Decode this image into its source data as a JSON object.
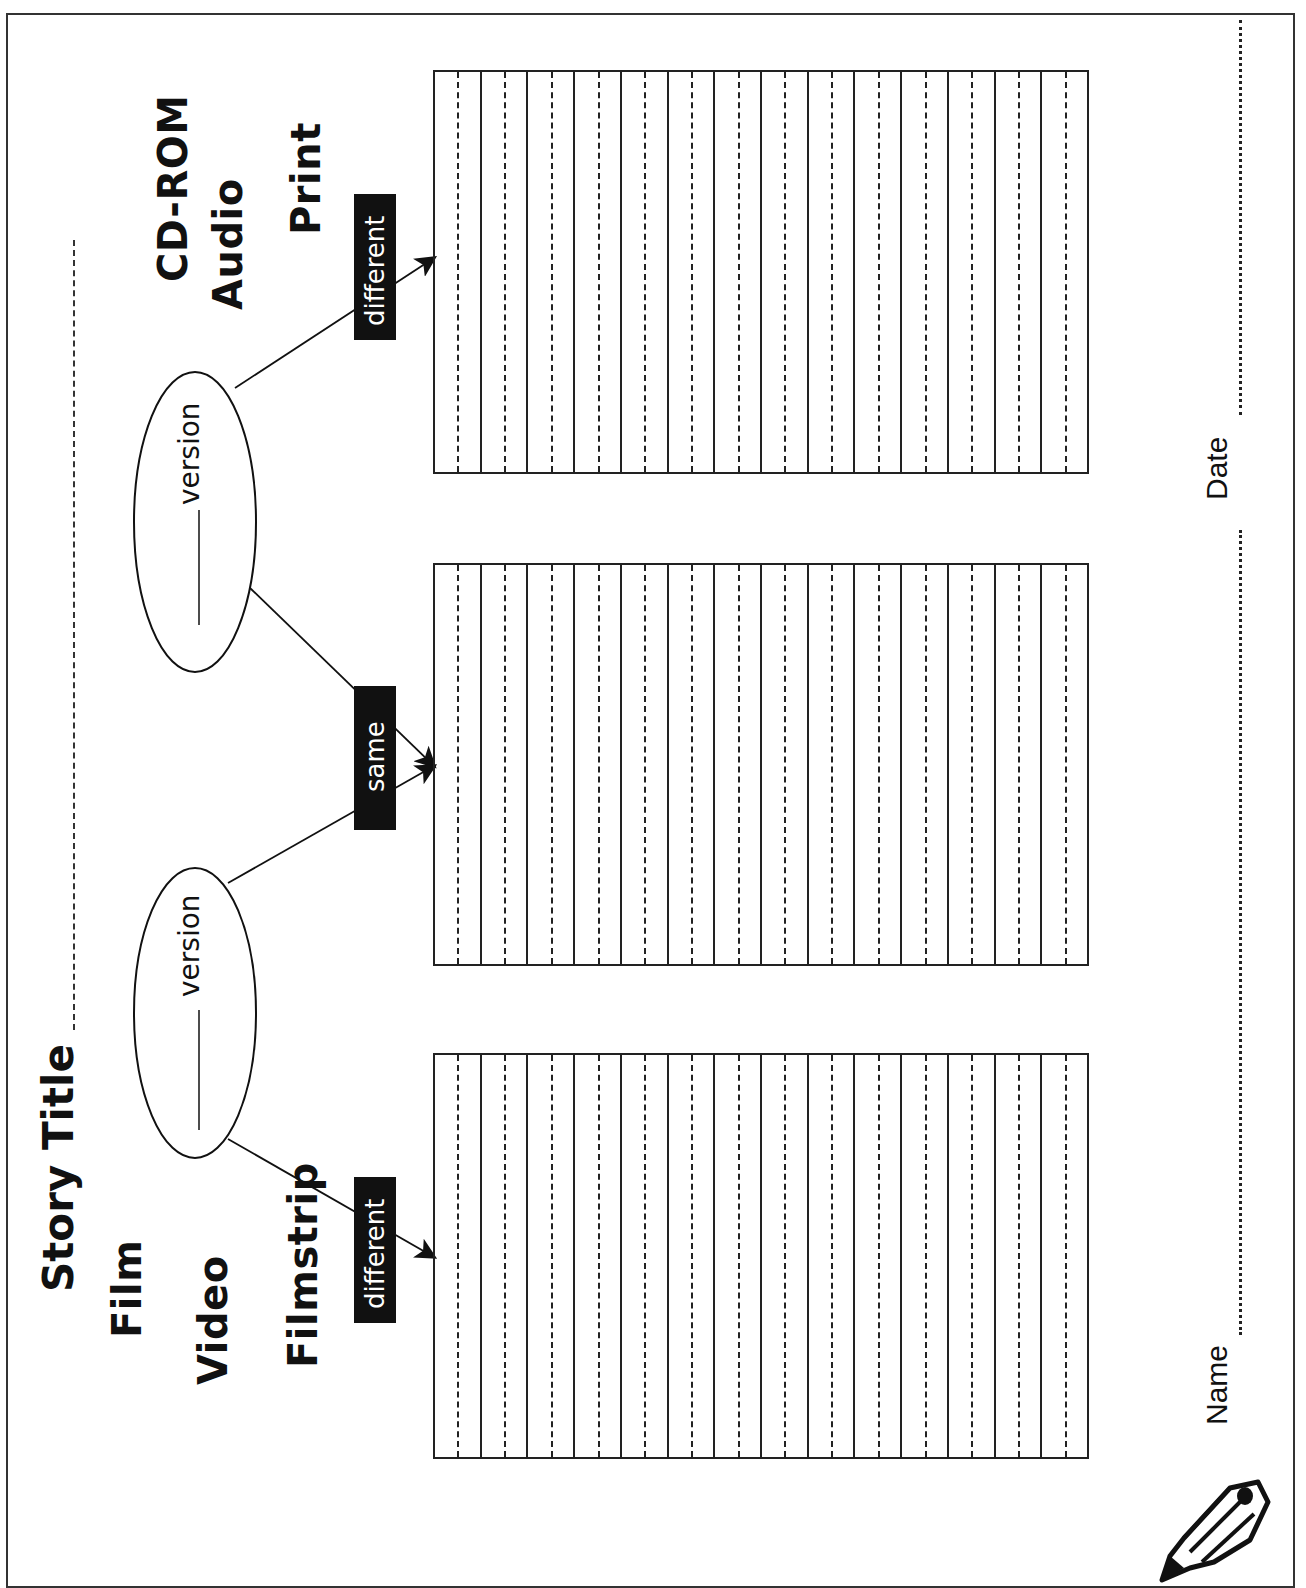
{
  "worksheet": {
    "story_title_label": "Story Title",
    "left_media": [
      "Film",
      "Video",
      "Filmstrip"
    ],
    "right_media": [
      "CD-ROM",
      "Audio",
      "Print"
    ],
    "ovals": [
      {
        "suffix": "version"
      },
      {
        "suffix": "version"
      }
    ],
    "connector_labels": {
      "left": "different",
      "middle": "same",
      "right": "different"
    },
    "ruled_boxes": [
      {
        "columns": 14
      },
      {
        "columns": 14
      },
      {
        "columns": 14
      }
    ],
    "footer": {
      "name_label": "Name",
      "date_label": "Date"
    },
    "icons": [
      "pencil-icon"
    ]
  }
}
